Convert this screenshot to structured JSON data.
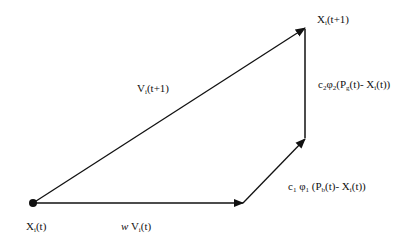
{
  "diagram": {
    "type": "vector-diagram",
    "labels": {
      "origin": {
        "base": "X",
        "sub": "i",
        "rest": "(t)"
      },
      "target": {
        "base": "X",
        "sub": "i",
        "rest": "(t+1)"
      },
      "new_velocity": {
        "base": "V",
        "sub": "i",
        "rest": "(t+1)"
      },
      "inertia": {
        "prefix": "w",
        "base": " V",
        "sub": "i",
        "rest": "(t)"
      },
      "cognitive": {
        "c": "c",
        "c_sub": "1",
        "phi": " φ",
        "phi_sub": "1",
        "mid": " (P",
        "p_sub": "b",
        "rest1": "(t)- X",
        "x_sub": "i",
        "rest2": "(t))"
      },
      "social": {
        "c": "c",
        "c_sub": "2",
        "phi": "φ",
        "phi_sub": "2",
        "mid": "(P",
        "p_sub": "g",
        "rest1": "(t)- X",
        "x_sub": "i",
        "rest2": "(t))"
      }
    },
    "nodes": [
      {
        "id": "origin",
        "x": 33,
        "y": 203
      },
      {
        "id": "inertia_end",
        "x": 243,
        "y": 203
      },
      {
        "id": "cognitive_end",
        "x": 305,
        "y": 138
      },
      {
        "id": "target",
        "x": 305,
        "y": 28
      }
    ],
    "edges": [
      {
        "from": "origin",
        "to": "inertia_end",
        "label": "inertia"
      },
      {
        "from": "inertia_end",
        "to": "cognitive_end",
        "label": "cognitive"
      },
      {
        "from": "cognitive_end",
        "to": "target",
        "label": "social"
      },
      {
        "from": "origin",
        "to": "target",
        "label": "new_velocity"
      }
    ],
    "stroke_color": "#111111"
  }
}
